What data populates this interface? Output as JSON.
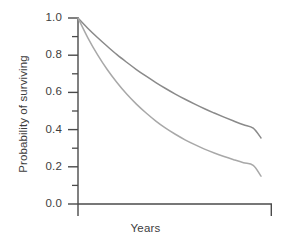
{
  "chart_data": {
    "type": "line",
    "title": "",
    "xlabel": "Years",
    "ylabel": "Probability of surviving",
    "xlim": [
      0,
      10
    ],
    "ylim": [
      0.0,
      1.0
    ],
    "grid": false,
    "legend_position": "none",
    "x_ticks": [],
    "x_tick_labels": [],
    "y_ticks": [
      0.0,
      0.2,
      0.4,
      0.6,
      0.8,
      1.0
    ],
    "y_tick_labels": [
      "0.0",
      "0.2",
      "0.4",
      "0.6",
      "0.8",
      "1.0"
    ],
    "y_minor_ticks": [
      0.1,
      0.3,
      0.5,
      0.7,
      0.9
    ],
    "series": [
      {
        "name": "upper-survival-curve",
        "color": "#8a8a8a",
        "x": [
          0,
          0.5,
          1,
          1.5,
          2,
          2.5,
          3,
          3.5,
          4,
          4.5,
          5,
          5.5,
          6,
          6.5,
          7,
          7.5,
          8,
          8.5,
          9,
          9.4
        ],
        "values": [
          1.0,
          0.945,
          0.895,
          0.848,
          0.803,
          0.762,
          0.723,
          0.687,
          0.653,
          0.621,
          0.591,
          0.563,
          0.537,
          0.512,
          0.489,
          0.467,
          0.446,
          0.426,
          0.408,
          0.355
        ]
      },
      {
        "name": "lower-survival-curve",
        "color": "#a8a8a8",
        "x": [
          0,
          0.5,
          1,
          1.5,
          2,
          2.5,
          3,
          3.5,
          4,
          4.5,
          5,
          5.5,
          6,
          6.5,
          7,
          7.5,
          8,
          8.5,
          9,
          9.4
        ],
        "values": [
          1.0,
          0.895,
          0.803,
          0.723,
          0.653,
          0.591,
          0.537,
          0.489,
          0.446,
          0.408,
          0.375,
          0.345,
          0.319,
          0.295,
          0.274,
          0.255,
          0.238,
          0.222,
          0.208,
          0.15
        ]
      }
    ],
    "axis_color": "#4a4a4a",
    "background_color": "#ffffff"
  },
  "axes": {
    "y_title": "Probability of surviving",
    "x_title": "Years",
    "labels": {
      "y0": "0.0",
      "y1": "0.2",
      "y2": "0.4",
      "y3": "0.6",
      "y4": "0.8",
      "y5": "1.0"
    }
  }
}
